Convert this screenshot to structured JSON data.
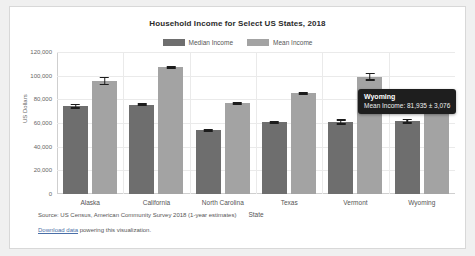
{
  "chart_data": {
    "type": "bar",
    "title": "Household Income for Select US States, 2018",
    "xlabel": "State",
    "ylabel": "US Dollars",
    "ylim": [
      0,
      120000
    ],
    "yticks": [
      "0",
      "20,000",
      "40,000",
      "60,000",
      "80,000",
      "100,000",
      "120,000"
    ],
    "ytick_values": [
      0,
      20000,
      40000,
      60000,
      80000,
      100000,
      120000
    ],
    "grid": true,
    "legend_position": "top-center",
    "categories": [
      "Alaska",
      "California",
      "North Carolina",
      "Texas",
      "Vermont",
      "Wyoming"
    ],
    "series": [
      {
        "name": "Median Income",
        "color": "#6e6e6e",
        "values": [
          74346,
          75277,
          53855,
          60629,
          60782,
          61584
        ],
        "errors": [
          2100,
          700,
          700,
          600,
          2300,
          2100
        ]
      },
      {
        "name": "Mean Income",
        "color": "#a3a3a3",
        "values": [
          95600,
          107000,
          76500,
          85200,
          99000,
          81935
        ],
        "errors": [
          3500,
          900,
          800,
          700,
          3400,
          3076
        ]
      }
    ]
  },
  "legend": {
    "entries": [
      {
        "label": "Median Income",
        "color": "#6e6e6e"
      },
      {
        "label": "Mean Income",
        "color": "#a3a3a3"
      }
    ]
  },
  "tooltip": {
    "title": "Wyoming",
    "value": "Mean Income: 81,935 ± 3,076"
  },
  "footer": {
    "source": "Source: US Census, American Community Survey 2018 (1-year estimates)",
    "link_text": "Download data",
    "link_suffix": " powering this visualization."
  }
}
